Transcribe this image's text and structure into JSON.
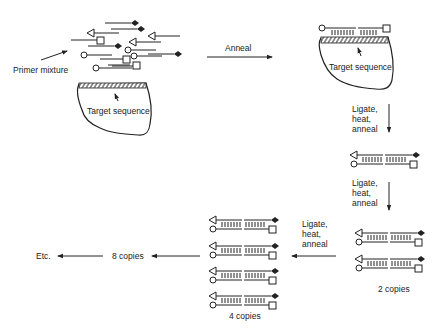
{
  "labels": {
    "primer_mixture": "Primer mixture",
    "target_sequence_left": "Target sequence",
    "anneal": "Anneal",
    "target_sequence_right": "Target sequence",
    "step1_l1": "Ligate,",
    "step1_l2": "heat,",
    "step1_l3": "anneal",
    "step2_l1": "Ligate,",
    "step2_l2": "heat,",
    "step2_l3": "anneal",
    "step3_l1": "Ligate,",
    "step3_l2": "heat,",
    "step3_l3": "anneal",
    "two_copies": "2 copies",
    "four_copies": "4 copies",
    "eight_copies": "8 copies",
    "etc": "Etc."
  },
  "icons": {
    "probe_end_a": "open-circle",
    "probe_end_b": "open-square",
    "probe_end_c": "open-triangle",
    "probe_end_d": "filled-diamond",
    "arrow": "arrow-head"
  },
  "colors": {
    "ink": "#222222",
    "background": "#ffffff"
  }
}
